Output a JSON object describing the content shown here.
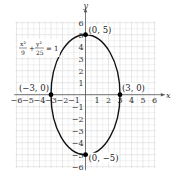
{
  "chart_data": {
    "type": "line",
    "title": "",
    "xlabel": "x",
    "ylabel": "y",
    "xlim": [
      -6,
      6
    ],
    "ylim": [
      -6,
      6
    ],
    "grid": true,
    "x_ticks": [
      -6,
      -5,
      -4,
      -3,
      -2,
      -1,
      1,
      2,
      3,
      4,
      5,
      6
    ],
    "y_ticks": [
      -6,
      -5,
      -4,
      -3,
      -2,
      -1,
      1,
      2,
      3,
      4,
      5,
      6
    ],
    "series": [
      {
        "name": "ellipse",
        "equation": "x^2/9 + y^2/25 = 1",
        "a": 3,
        "b": 5,
        "center": [
          0,
          0
        ]
      }
    ],
    "points": [
      {
        "x": 0,
        "y": 5,
        "label": "(0, 5)"
      },
      {
        "x": 0,
        "y": -5,
        "label": "(0, −5)"
      },
      {
        "x": 3,
        "y": 0,
        "label": "(3, 0)"
      },
      {
        "x": -3,
        "y": 0,
        "label": "(−3, 0)"
      }
    ],
    "annotations": [
      {
        "text": "x²/9 + y²/25 = 1",
        "x": -5.5,
        "y": 3.5
      }
    ]
  },
  "equation": {
    "x_num": "x²",
    "x_den": "9",
    "plus": "+",
    "y_num": "y²",
    "y_den": "25",
    "rhs": "= 1"
  },
  "colors": {
    "grid": "#d9d9d9",
    "axis": "#555555",
    "curve": "#111111",
    "point": "#000000"
  }
}
